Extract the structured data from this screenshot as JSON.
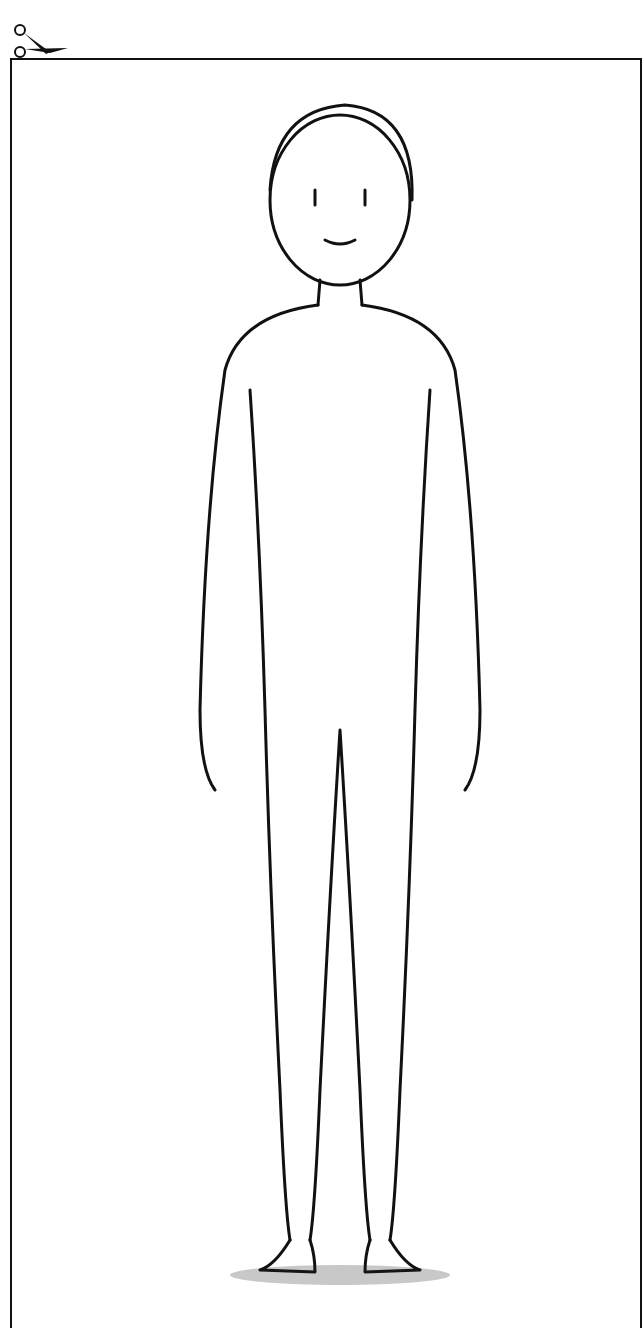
{
  "card": {
    "type": "cut-out illustration card",
    "border_color": "#111111",
    "background": "#ffffff"
  },
  "icons": {
    "scissors": "scissors-icon"
  },
  "illustration": {
    "subject": "standing figure outline (simplified silhouette)",
    "style": "black line art on white"
  }
}
